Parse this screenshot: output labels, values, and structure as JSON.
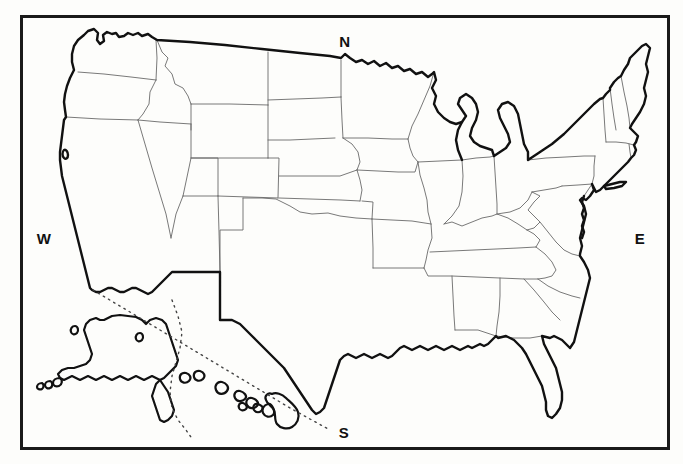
{
  "figure": {
    "kind": "outline-map",
    "style": "black and white blank outline map with state boundaries",
    "background_color": "#fdfdfb",
    "frame": {
      "present": true,
      "color": "#1a1a1a",
      "thickness_px": 3,
      "x": 20,
      "y": 15,
      "width": 650,
      "height": 435
    },
    "line_colors": {
      "national_outline": "#111111",
      "state_border": "#6a6a6a",
      "international_border_dotted": "#444444"
    }
  },
  "compass": {
    "north": {
      "label": "N",
      "x": 345,
      "y": 41
    },
    "south": {
      "label": "S",
      "x": 344,
      "y": 432
    },
    "west": {
      "label": "W",
      "x": 44,
      "y": 238
    },
    "east": {
      "label": "E",
      "x": 640,
      "y": 238
    }
  },
  "regions": {
    "contiguous": "48 contiguous states shown with interior state boundary lines",
    "insets": [
      {
        "name": "Alaska",
        "position": "lower-left"
      },
      {
        "name": "Hawaii",
        "position": "lower-center"
      }
    ]
  },
  "annotations": {
    "dotted_lines": [
      "diagonal dotted inset divider running from lower-left toward lower-center",
      "curved dotted inset divider around Alaska panhandle"
    ]
  }
}
